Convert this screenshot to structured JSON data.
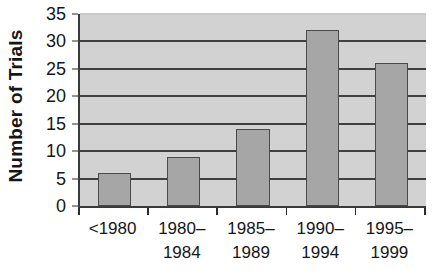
{
  "chart_data": {
    "type": "bar",
    "title": "",
    "xlabel": "",
    "ylabel": "Number of Trials",
    "categories": [
      "<1980",
      "1980–\n1984",
      "1985–\n1989",
      "1990–\n1994",
      "1995–\n1999"
    ],
    "values": [
      6,
      9,
      14,
      32,
      26
    ],
    "ylim": [
      0,
      35
    ],
    "yticks": [
      0,
      5,
      10,
      15,
      20,
      25,
      30,
      35
    ],
    "ytick_labels": [
      "0",
      "5",
      "10",
      "15",
      "20",
      "25",
      "30",
      "35"
    ],
    "grid": true,
    "grid_axis": "y",
    "legend": false,
    "legend_position": "none",
    "colors": {
      "bar_fill": "#a6a6a6",
      "bar_border": "#4a4a4a",
      "plot_background": "#d2d2d2",
      "gridline": "#3f3f3f",
      "axis_line": "#3a3a3a",
      "text": "#161616",
      "figure_background": "#ffffff"
    }
  }
}
